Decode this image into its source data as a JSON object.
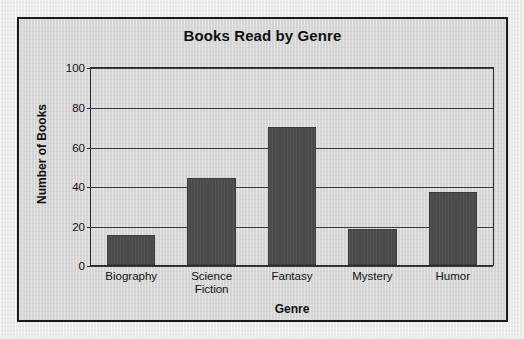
{
  "chart_data": {
    "type": "bar",
    "title": "Books Read by Genre",
    "xlabel": "Genre",
    "ylabel": "Number of Books",
    "categories": [
      "Biography",
      "Science\nFiction",
      "Fantasy",
      "Mystery",
      "Humor"
    ],
    "category_labels": [
      {
        "line1": "Biography",
        "line2": ""
      },
      {
        "line1": "Science",
        "line2": "Fiction"
      },
      {
        "line1": "Fantasy",
        "line2": ""
      },
      {
        "line1": "Mystery",
        "line2": ""
      },
      {
        "line1": "Humor",
        "line2": ""
      }
    ],
    "values": [
      15,
      44,
      70,
      18.5,
      37
    ],
    "ylim": [
      0,
      100
    ],
    "yticks": [
      0,
      20,
      40,
      60,
      80,
      100
    ],
    "ytick_labels": [
      "0",
      "20",
      "40",
      "60",
      "80",
      "100"
    ],
    "grid": true,
    "legend": false,
    "bar_color": "#4a4a4a",
    "panel_background": "#d6d6d6",
    "page_background": "#eaeaea",
    "axis_color": "#2a2a2a"
  }
}
